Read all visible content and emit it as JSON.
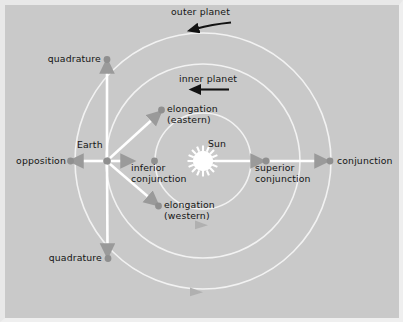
{
  "figure": {
    "background_color": "#c9c9c9",
    "orbit_color": "#f2f2f2",
    "marker_color": "#8f8f8f",
    "arrow_color": "#ffffff",
    "dark_arrow_color": "#121212",
    "text_color": "#141414",
    "sun_color": "#ffffff"
  },
  "bodies": {
    "sun": {
      "label": "Sun",
      "x": 203,
      "y": 161
    },
    "earth": {
      "label": "Earth",
      "x": 107,
      "y": 161
    }
  },
  "orbits": [
    {
      "name": "inner-planet-orbit",
      "radius": 48,
      "label": "inner planet",
      "direction": "counterclockwise"
    },
    {
      "name": "earth-orbit",
      "radius": 97,
      "label": "",
      "direction": "counterclockwise"
    },
    {
      "name": "outer-planet-orbit",
      "radius": 128,
      "label": "outer planet",
      "direction": "counterclockwise"
    }
  ],
  "motion_labels": {
    "outer_planet": "outer planet",
    "inner_planet": "inner planet"
  },
  "configurations": [
    {
      "name": "quadrature-upper",
      "label": "quadrature",
      "x": 107,
      "y": 59
    },
    {
      "name": "quadrature-lower",
      "label": "quadrature",
      "x": 108,
      "y": 258
    },
    {
      "name": "opposition",
      "label": "opposition",
      "x": 70,
      "y": 161
    },
    {
      "name": "conjunction",
      "label": "conjunction",
      "x": 330,
      "y": 161
    },
    {
      "name": "superior-conjunction",
      "label": "superior\nconjunction",
      "label_line1": "superior",
      "label_line2": "conjunction",
      "x": 266,
      "y": 161
    },
    {
      "name": "inferior-conjunction",
      "label_line1": "inferior",
      "label_line2": "conjunction",
      "x": 155,
      "y": 161
    },
    {
      "name": "elongation-eastern",
      "label_line1": "elongation",
      "label_line2": "(eastern)",
      "x": 162,
      "y": 110
    },
    {
      "name": "elongation-western",
      "label_line1": "elongation",
      "label_line2": "(western)",
      "x": 159,
      "y": 206
    }
  ],
  "labels": {
    "outer_planet": "outer planet",
    "inner_planet": "inner planet",
    "quadrature_upper": "quadrature",
    "quadrature_lower": "quadrature",
    "opposition": "opposition",
    "earth": "Earth",
    "sun": "Sun",
    "conjunction": "conjunction",
    "superior_conjunction_l1": "superior",
    "superior_conjunction_l2": "conjunction",
    "inferior_conjunction_l1": "inferior",
    "inferior_conjunction_l2": "conjunction",
    "elongation_eastern_l1": "elongation",
    "elongation_eastern_l2": "(eastern)",
    "elongation_western_l1": "elongation",
    "elongation_western_l2": "(western)"
  }
}
